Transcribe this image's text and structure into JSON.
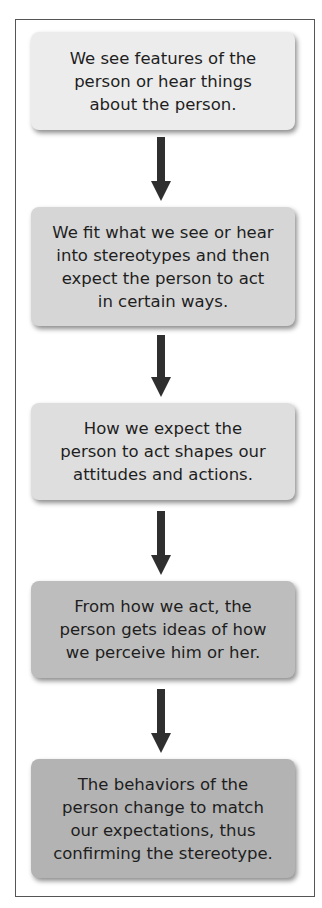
{
  "diagram": {
    "type": "vertical-flowchart",
    "title": "",
    "steps": [
      {
        "label": "We see features of the person or hear things about the person.",
        "lines": [
          "We see features of the",
          "person or hear things",
          "about the person."
        ],
        "fill": "#ececec"
      },
      {
        "label": "We fit what we see or hear into stereotypes and then expect the person to act in certain ways.",
        "lines": [
          "We fit what we see or hear",
          "into stereotypes and then",
          "expect the person to act",
          "in certain ways."
        ],
        "fill": "#d6d6d6"
      },
      {
        "label": "How we expect the person to act shapes our attitudes and actions.",
        "lines": [
          "How we expect the",
          "person to act shapes our",
          "attitudes and actions."
        ],
        "fill": "#dedede"
      },
      {
        "label": "From how we act, the person gets ideas of how we perceive him or her.",
        "lines": [
          "From how we act, the",
          "person gets ideas of how",
          "we perceive him or her."
        ],
        "fill": "#bdbdbd"
      },
      {
        "label": "The behaviors of the person change to match our expectations, thus confirming the stereotype.",
        "lines": [
          "The behaviors of the",
          "person change to match",
          "our expectations, thus",
          "confirming the stereotype."
        ],
        "fill": "#b3b3b3"
      }
    ],
    "arrows": [
      {
        "from": 0,
        "to": 1
      },
      {
        "from": 1,
        "to": 2
      },
      {
        "from": 2,
        "to": 3
      },
      {
        "from": 3,
        "to": 4
      }
    ],
    "colors": {
      "frame_border": "#555555",
      "arrow": "#2f2f2f",
      "text": "#1e1e1e"
    }
  }
}
